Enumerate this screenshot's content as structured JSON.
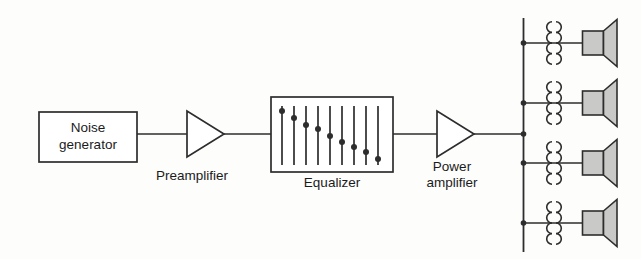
{
  "colors": {
    "background": "#fdfdfc",
    "line": "#2d2d2d",
    "text": "#1b1b1b",
    "speaker_fill": "#c9c9c7",
    "shape_fill": "#ffffff"
  },
  "blocks": {
    "noise_generator": {
      "label": [
        "Noise",
        "generator"
      ]
    },
    "preamplifier": {
      "label": "Preamplifier"
    },
    "equalizer": {
      "label": "Equalizer",
      "sliders": [
        {
          "x": 282,
          "knob_y": 111
        },
        {
          "x": 294,
          "knob_y": 118
        },
        {
          "x": 306,
          "knob_y": 125
        },
        {
          "x": 318,
          "knob_y": 129
        },
        {
          "x": 330,
          "knob_y": 136
        },
        {
          "x": 342,
          "knob_y": 142
        },
        {
          "x": 354,
          "knob_y": 147
        },
        {
          "x": 366,
          "knob_y": 152
        },
        {
          "x": 378,
          "knob_y": 159
        }
      ]
    },
    "power_amplifier": {
      "label": [
        "Power",
        "amplifier"
      ]
    }
  },
  "output_network": {
    "speaker_count": 4,
    "branches": [
      {
        "y": 43
      },
      {
        "y": 103
      },
      {
        "y": 163
      },
      {
        "y": 223
      }
    ]
  }
}
